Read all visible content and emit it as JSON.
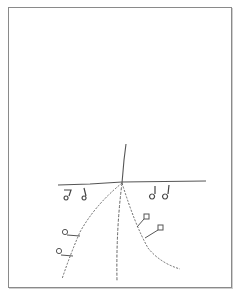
{
  "diagram": {
    "stroke_color": "#555555",
    "frame_color": "#8a8a8a",
    "elements": {
      "horizontal_line": {
        "x1": 58,
        "y1": 184,
        "x2": 206,
        "y2": 181
      },
      "vertical_line": {
        "x1": 126,
        "y1": 144,
        "x2": 122,
        "y2": 183
      },
      "dashed_left": "M122 183 Q95 205 80 232 Q70 255 62 279",
      "dashed_center": "M122 183 Q116 230 117 281",
      "dashed_right": "M122 183 Q135 225 148 248 Q160 263 180 269",
      "glyphs_left": [
        {
          "x": 68,
          "y": 194
        },
        {
          "x": 85,
          "y": 193
        }
      ],
      "glyphs_right": [
        {
          "x": 153,
          "y": 191
        },
        {
          "x": 167,
          "y": 191
        }
      ],
      "callouts_left": [
        {
          "cx": 64,
          "cy": 233,
          "lx": 80,
          "ly": 236
        },
        {
          "cx": 58,
          "cy": 252,
          "lx": 73,
          "ly": 256
        }
      ],
      "callouts_right": [
        {
          "cx": 147,
          "cy": 218,
          "lx": 136,
          "ly": 226
        },
        {
          "cx": 160,
          "cy": 228,
          "lx": 144,
          "ly": 238
        }
      ]
    }
  }
}
